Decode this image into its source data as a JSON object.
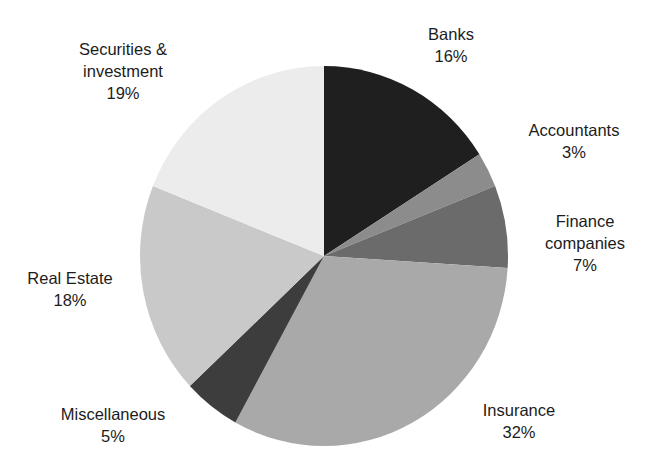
{
  "chart_data": {
    "type": "pie",
    "title": "",
    "start_angle_deg": 0,
    "direction": "clockwise",
    "slices": [
      {
        "name": "Banks",
        "label_lines": [
          "Banks"
        ],
        "value": 16,
        "value_label": "16%",
        "color": "#1f1f1f"
      },
      {
        "name": "Accountants",
        "label_lines": [
          "Accountants"
        ],
        "value": 3,
        "value_label": "3%",
        "color": "#8c8c8c"
      },
      {
        "name": "Finance companies",
        "label_lines": [
          "Finance",
          "companies"
        ],
        "value": 7,
        "value_label": "7%",
        "color": "#6b6b6b"
      },
      {
        "name": "Insurance",
        "label_lines": [
          "Insurance"
        ],
        "value": 32,
        "value_label": "32%",
        "color": "#a9a9a9"
      },
      {
        "name": "Miscellaneous",
        "label_lines": [
          "Miscellaneous"
        ],
        "value": 5,
        "value_label": "5%",
        "color": "#3d3d3d"
      },
      {
        "name": "Real Estate",
        "label_lines": [
          "Real Estate"
        ],
        "value": 18,
        "value_label": "18%",
        "color": "#c9c9c9"
      },
      {
        "name": "Securities & investment",
        "label_lines": [
          "Securities &",
          "investment"
        ],
        "value": 19,
        "value_label": "19%",
        "color": "#ececec"
      }
    ],
    "legend": "none (direct labels)"
  },
  "labels": {
    "banks": {
      "line1": "Banks",
      "pct": "16%"
    },
    "accountants": {
      "line1": "Accountants",
      "pct": "3%"
    },
    "finance": {
      "line1": "Finance",
      "line2": "companies",
      "pct": "7%"
    },
    "insurance": {
      "line1": "Insurance",
      "pct": "32%"
    },
    "misc": {
      "line1": "Miscellaneous",
      "pct": "5%"
    },
    "realestate": {
      "line1": "Real Estate",
      "pct": "18%"
    },
    "securities": {
      "line1": "Securities &",
      "line2": "investment",
      "pct": "19%"
    }
  }
}
